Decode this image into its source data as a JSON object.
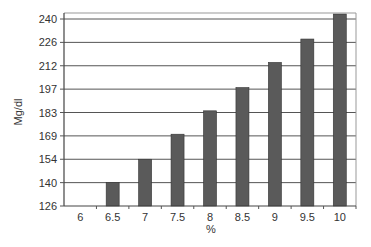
{
  "chart_data": {
    "type": "bar",
    "title": "",
    "xlabel": "%",
    "ylabel": "Mg/dl",
    "categories": [
      "6",
      "6.5",
      "7",
      "7.5",
      "8",
      "8.5",
      "9",
      "9.5",
      "10"
    ],
    "values": [
      126,
      140,
      154,
      170,
      184,
      198,
      214,
      228,
      243
    ],
    "yticks": [
      126,
      140,
      154,
      169,
      183,
      197,
      212,
      226,
      240
    ],
    "ylim": [
      126,
      240
    ],
    "grid": true,
    "legend": null,
    "bar_color": "#5a5a5a"
  }
}
